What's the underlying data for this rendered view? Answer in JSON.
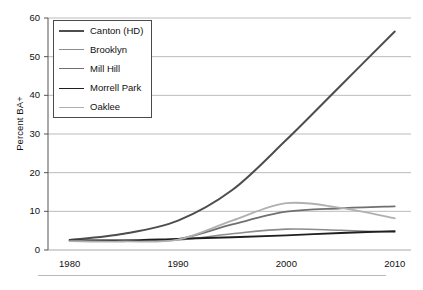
{
  "chart_data": {
    "type": "line",
    "title": "",
    "xlabel": "",
    "ylabel": "Percent BA+",
    "xlim": [
      1978,
      2011.5
    ],
    "ylim": [
      0,
      60
    ],
    "ytick_values": [
      0,
      10,
      20,
      30,
      40,
      50,
      60
    ],
    "ytick_labels": [
      "0",
      "10",
      "20",
      "30",
      "40",
      "50",
      "60"
    ],
    "xtick_values": [
      1980,
      1990,
      2000,
      2010
    ],
    "xtick_labels": [
      "1980",
      "1990",
      "2000",
      "2010"
    ],
    "grid": "horizontal",
    "legend_position": "upper-left-inside",
    "x": [
      1980,
      1985,
      1990,
      1995,
      2000,
      2005,
      2010
    ],
    "series": [
      {
        "name": "Canton (HD)",
        "color": "#4d4d4d",
        "width": 2.0,
        "values": [
          2.6,
          4.2,
          7.6,
          15.5,
          28.5,
          42.5,
          56.5
        ]
      },
      {
        "name": "Brooklyn",
        "color": "#8c8c8c",
        "width": 1.6,
        "values": [
          2.4,
          2.3,
          2.6,
          4.2,
          5.4,
          5.1,
          4.6
        ]
      },
      {
        "name": "Mill Hill",
        "color": "#707070",
        "width": 1.8,
        "values": [
          2.5,
          2.4,
          2.8,
          6.6,
          9.9,
          10.8,
          11.3
        ]
      },
      {
        "name": "Morrell Park",
        "color": "#1f1f1f",
        "width": 1.8,
        "values": [
          2.5,
          2.5,
          2.9,
          3.3,
          3.8,
          4.4,
          4.9
        ]
      },
      {
        "name": "Oaklee",
        "color": "#b0b0b0",
        "width": 1.8,
        "values": [
          2.3,
          2.2,
          2.7,
          7.6,
          12.1,
          10.9,
          8.2
        ]
      }
    ]
  },
  "axes": {
    "y_title": "Percent BA+",
    "gridline_color": "#a9a9a9",
    "axis_color": "#555555"
  },
  "legend": {
    "items": [
      {
        "label": "Canton (HD)"
      },
      {
        "label": "Brooklyn"
      },
      {
        "label": "Mill Hill"
      },
      {
        "label": "Morrell Park"
      },
      {
        "label": "Oaklee"
      }
    ]
  }
}
